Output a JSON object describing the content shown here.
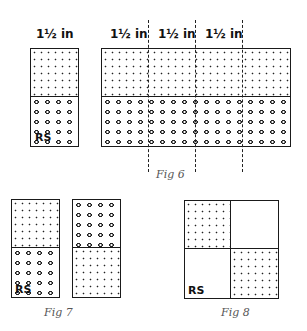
{
  "fig6": {
    "caption": "Fig 6",
    "single_label": "1½ in",
    "strip_labels": [
      "1½ in",
      "1½ in",
      "1½ in"
    ],
    "rs_label": "RS",
    "top_pattern": "fine-dots",
    "bottom_pattern": "coarse-circles"
  },
  "fig7": {
    "caption": "Fig 7",
    "rs_label": "RS",
    "left_block": {
      "top": "fine-dots",
      "bottom": "coarse-circles"
    },
    "right_block": {
      "top": "coarse-circles",
      "bottom": "fine-dots"
    }
  },
  "fig8": {
    "caption": "Fig 8",
    "rs_label": "RS",
    "quadrants": {
      "top_left": "fine-dots",
      "top_right": "empty",
      "bottom_left": "empty",
      "bottom_right": "fine-dots"
    }
  }
}
